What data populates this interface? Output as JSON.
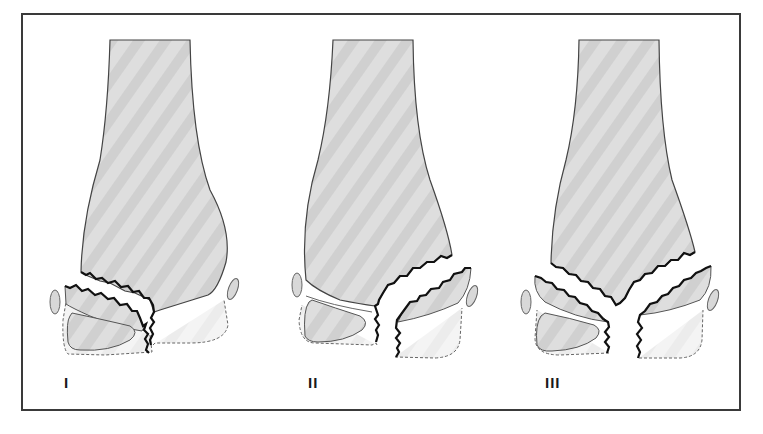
{
  "figure": {
    "colors": {
      "bone_fill": "#dcdcdc",
      "bone_stripe": "#cfcfcf",
      "cartilage_fill": "#f3f3f3",
      "outline": "#555555",
      "fracture_line": "#111111",
      "frame": "#3a3a3a"
    },
    "panels": [
      {
        "id": "I",
        "label": "I",
        "fracture": "through physis and metaphysis (lateral)"
      },
      {
        "id": "II",
        "label": "II",
        "fracture": "through metaphysis, physis, and epiphysis (medial)"
      },
      {
        "id": "III",
        "label": "III",
        "fracture": "bilateral, V-shaped through metaphysis with central split"
      }
    ]
  }
}
